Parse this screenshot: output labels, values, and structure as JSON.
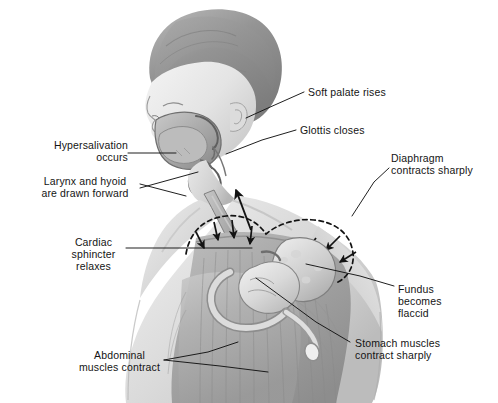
{
  "figure": {
    "background_color": "#ffffff",
    "ink_color": "#141414",
    "tone_colors": {
      "hair_dark": "#8a8a8a",
      "hair_light": "#b4b4b4",
      "skin_light": "#efefef",
      "skin_mid": "#d8d8d8",
      "skin_shadow": "#bdbdbd",
      "muscle_mid": "#a8a8a8",
      "muscle_dark": "#8f8f8f",
      "organ_light": "#e2e2e2",
      "organ_mid": "#c2c2c2",
      "cavity_dark": "#9a9a9a"
    }
  },
  "callouts": [
    {
      "id": "soft-palate",
      "name": "callout-soft-palate-rises",
      "text": "Soft palate rises",
      "align": "left",
      "x": 308,
      "y": 86
    },
    {
      "id": "glottis",
      "name": "callout-glottis-closes",
      "text": "Glottis closes",
      "align": "left",
      "x": 300,
      "y": 124
    },
    {
      "id": "diaphragm",
      "name": "callout-diaphragm-contracts-sharply",
      "text": "Diaphragm\ncontracts sharply",
      "align": "left",
      "x": 391,
      "y": 152
    },
    {
      "id": "hypersalivation",
      "name": "callout-hypersalivation-occurs",
      "text": "Hypersalivation\noccurs",
      "align": "right",
      "x": 24,
      "y": 139
    },
    {
      "id": "larynx-hyoid",
      "name": "callout-larynx-and-hyoid-are-drawn-forward",
      "text": "Larynx and hyoid\nare drawn forward",
      "align": "center",
      "x": 30,
      "y": 175
    },
    {
      "id": "cardiac-sphincter",
      "name": "callout-cardiac-sphincter-relaxes",
      "text": "Cardiac\nsphincter\nrelaxes",
      "align": "center",
      "x": 61,
      "y": 236
    },
    {
      "id": "fundus",
      "name": "callout-fundus-becomes-flaccid",
      "text": "Fundus\nbecomes\nflaccid",
      "align": "left",
      "x": 398,
      "y": 283
    },
    {
      "id": "stomach-muscles",
      "name": "callout-stomach-muscles-contract-sharply",
      "text": "Stomach muscles\ncontract sharply",
      "align": "left",
      "x": 355,
      "y": 337
    },
    {
      "id": "abdominal-muscles",
      "name": "callout-abdominal-muscles-contract",
      "text": "Abdominal\nmuscles contract",
      "align": "center",
      "x": 75,
      "y": 349
    }
  ],
  "annotation_marks": {
    "diaphragm_outline": "dashed arc over the superior abdominal cavity",
    "diaphragm_arrow_count": 7,
    "diaphragm_arrow_direction": "inward / downward toward the stomach",
    "esophagus_arrow_direction": "upward toward the pharynx"
  }
}
